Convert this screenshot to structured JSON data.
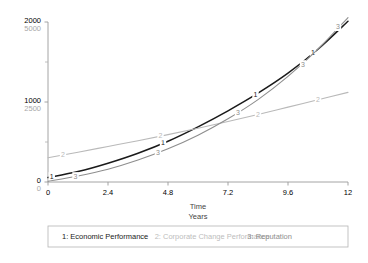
{
  "chart_data": {
    "type": "line",
    "title": "",
    "xlabel": "Time",
    "xlabel_sub": "Years",
    "ylabel": "",
    "xlim": [
      0,
      12
    ],
    "ylim": [
      0,
      2000
    ],
    "ylim_secondary": [
      0,
      5000
    ],
    "grid": false,
    "legend_position": "bottom",
    "x_ticks": [
      "0",
      "2.4",
      "4.8",
      "7.2",
      "9.6",
      "12"
    ],
    "x_tick_values": [
      0,
      2.4,
      4.8,
      7.2,
      9.6,
      12
    ],
    "y_ticks_primary": [
      "0",
      "1000",
      "2000"
    ],
    "y_tick_values_primary": [
      0,
      1000,
      2000
    ],
    "y_ticks_secondary": [
      "0",
      "2500",
      "5000"
    ],
    "y_tick_values_secondary": [
      0,
      2500,
      5000
    ],
    "y_minor_tick_values": [
      500,
      1500
    ],
    "series": [
      {
        "name": "Economic Performance",
        "key": "1",
        "color": "#1a1a1a",
        "axis": "primary",
        "x": [
          0,
          1.2,
          2.4,
          3.6,
          4.8,
          6.0,
          7.2,
          8.4,
          9.6,
          10.8,
          12.0
        ],
        "values": [
          55,
          130,
          235,
          360,
          510,
          690,
          890,
          1110,
          1360,
          1660,
          2010
        ],
        "marker_points": [
          {
            "x": 0.15,
            "y": 70,
            "label": "1"
          },
          {
            "x": 4.6,
            "y": 490,
            "label": "1"
          },
          {
            "x": 8.3,
            "y": 1090,
            "label": "1"
          },
          {
            "x": 10.6,
            "y": 1620,
            "label": "1"
          }
        ]
      },
      {
        "name": "Corporate Change Performance",
        "key": "2",
        "color": "#b9b9b9",
        "axis": "secondary",
        "x": [
          0,
          1.2,
          2.4,
          3.6,
          4.8,
          6.0,
          7.2,
          8.4,
          9.6,
          10.8,
          12.0
        ],
        "values": [
          760,
          930,
          1110,
          1290,
          1480,
          1680,
          1890,
          2110,
          2340,
          2570,
          2800
        ],
        "marker_points": [
          {
            "x": 0.6,
            "y": 845,
            "label": "2"
          },
          {
            "x": 4.5,
            "y": 1430,
            "label": "2"
          },
          {
            "x": 8.4,
            "y": 2110,
            "label": "2"
          },
          {
            "x": 10.8,
            "y": 2570,
            "label": "2"
          }
        ]
      },
      {
        "name": "Reputation",
        "key": "3",
        "color": "#8e8e8e",
        "axis": "primary",
        "x": [
          0,
          1.2,
          2.4,
          3.6,
          4.8,
          6.0,
          7.2,
          8.4,
          9.6,
          10.8,
          12.0
        ],
        "values": [
          10,
          75,
          160,
          275,
          415,
          585,
          790,
          1030,
          1320,
          1660,
          2055
        ],
        "marker_points": [
          {
            "x": 1.1,
            "y": 70,
            "label": "3"
          },
          {
            "x": 4.4,
            "y": 370,
            "label": "3"
          },
          {
            "x": 7.6,
            "y": 860,
            "label": "3"
          },
          {
            "x": 10.2,
            "y": 1470,
            "label": "3"
          },
          {
            "x": 11.6,
            "y": 1940,
            "label": "3"
          }
        ]
      }
    ]
  },
  "legend": {
    "entries": [
      {
        "label": "1: Economic Performance",
        "color": "#1a1a1a"
      },
      {
        "label": "2: Corporate Change Performance",
        "color": "#bdbdbd"
      },
      {
        "label": "3: Reputation",
        "color": "#8e8e8e"
      }
    ]
  },
  "axes": {
    "x_title": "Time",
    "x_subtitle": "Years"
  }
}
